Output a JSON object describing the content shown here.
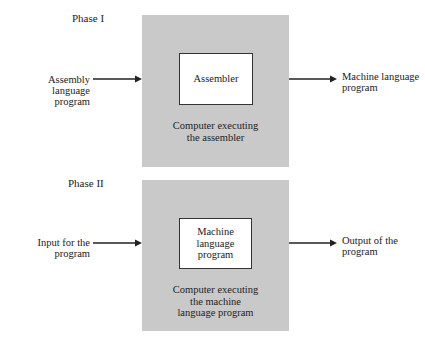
{
  "phase1": {
    "title": "Phase I",
    "input_label": "Assembly language\nprogram",
    "inner_box_label": "Assembler",
    "caption": "Computer executing\nthe assembler",
    "output_label": "Machine language\nprogram"
  },
  "phase2": {
    "title": "Phase II",
    "input_label": "Input for the\nprogram",
    "inner_box_label": "Machine\nlanguage\nprogram",
    "caption": "Computer executing\nthe machine\nlanguage program",
    "output_label": "Output of the\nprogram"
  },
  "colors": {
    "computer_box": "#c9c9c9",
    "inner_box": "#ffffff",
    "line": "#222222"
  }
}
